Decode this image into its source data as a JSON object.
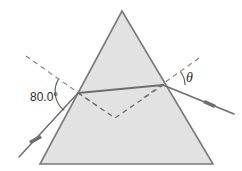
{
  "figure": {
    "name": "prism-refraction-diagram",
    "type": "optics-ray-diagram",
    "background_color": "#ffffff"
  },
  "prism": {
    "name": "equilateral-prism",
    "fill_color": "#e2e2e2",
    "stroke_color": "#7a7a7a",
    "apex": {
      "x": 122,
      "y": 11
    },
    "bottom_left": {
      "x": 40,
      "y": 164
    },
    "bottom_right": {
      "x": 213,
      "y": 164
    }
  },
  "points": {
    "entry": {
      "x": 78,
      "y": 93
    },
    "exit": {
      "x": 163,
      "y": 85
    },
    "internal_dashed_vertex": {
      "x": 115,
      "y": 118
    }
  },
  "rays": {
    "incident": {
      "name": "incident-ray",
      "from": {
        "x": 19,
        "y": 157
      },
      "to": {
        "x": 78,
        "y": 93
      },
      "arrow_at": {
        "x": 36,
        "y": 139
      },
      "arrow_direction": "down-left",
      "style": "solid"
    },
    "internal": {
      "name": "internal-refracted-ray",
      "from": {
        "x": 78,
        "y": 93
      },
      "to": {
        "x": 163,
        "y": 85
      },
      "style": "solid"
    },
    "exit": {
      "name": "exit-ray",
      "from": {
        "x": 163,
        "y": 85
      },
      "to": {
        "x": 232,
        "y": 113
      },
      "arrow_at": {
        "x": 210,
        "y": 104
      },
      "arrow_direction": "down-right",
      "style": "solid"
    },
    "dashed_extension_left": {
      "name": "incident-ray-extension-dashed",
      "from": {
        "x": 78,
        "y": 93
      },
      "to": {
        "x": 115,
        "y": 118
      },
      "style": "dashed"
    },
    "dashed_extension_right": {
      "name": "exit-ray-extension-dashed",
      "from": {
        "x": 115,
        "y": 118
      },
      "to": {
        "x": 163,
        "y": 85
      },
      "style": "dashed"
    }
  },
  "normals": {
    "left": {
      "name": "normal-line-left",
      "from": {
        "x": 26,
        "y": 56
      },
      "to": {
        "x": 100,
        "y": 108
      },
      "style": "dashed"
    },
    "right": {
      "name": "normal-line-right",
      "from": {
        "x": 199,
        "y": 58
      },
      "to": {
        "x": 143,
        "y": 98
      },
      "style": "dashed"
    }
  },
  "labels": {
    "incidence_angle": {
      "name": "angle-label-80",
      "text": "80.0°",
      "x": 30,
      "y": 101
    },
    "exit_angle": {
      "name": "angle-label-theta",
      "text": "θ",
      "x": 186,
      "y": 82
    }
  },
  "arcs": {
    "incidence": {
      "name": "angle-arc-80",
      "center": {
        "x": 78,
        "y": 93
      },
      "radius": 24,
      "start_deg": 215,
      "end_deg": 305
    },
    "exit": {
      "name": "angle-arc-theta",
      "center": {
        "x": 163,
        "y": 85
      },
      "radius": 22,
      "start_deg": 0,
      "end_deg": 38
    }
  }
}
